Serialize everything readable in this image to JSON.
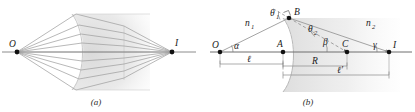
{
  "figure": {
    "type": "optics-diagram",
    "panels": [
      {
        "id": "a",
        "caption": "(a)",
        "points": [
          {
            "label": "O",
            "name": "object-point"
          },
          {
            "label": "I",
            "name": "image-point"
          }
        ]
      },
      {
        "id": "b",
        "caption": "(b)",
        "points": [
          {
            "label": "O",
            "name": "object-point"
          },
          {
            "label": "A",
            "name": "vertex-point"
          },
          {
            "label": "B",
            "name": "incidence-point"
          },
          {
            "label": "C",
            "name": "center-of-curvature"
          },
          {
            "label": "I",
            "name": "image-point"
          }
        ],
        "angles": [
          {
            "label": "θ",
            "sub": "1",
            "name": "angle-of-incidence"
          },
          {
            "label": "θ",
            "sub": "2",
            "name": "angle-of-refraction"
          },
          {
            "label": "α",
            "sub": "",
            "name": "angle-alpha"
          },
          {
            "label": "β",
            "sub": "",
            "name": "angle-beta"
          },
          {
            "label": "γ",
            "sub": "",
            "name": "angle-gamma"
          }
        ],
        "indices": [
          {
            "label": "n",
            "sub": "1",
            "name": "refractive-index-left"
          },
          {
            "label": "n",
            "sub": "2",
            "name": "refractive-index-right"
          }
        ],
        "distances": [
          {
            "label": "ℓ",
            "name": "object-distance"
          },
          {
            "label": "R",
            "name": "radius-of-curvature"
          },
          {
            "label": "ℓ′",
            "name": "image-distance"
          }
        ]
      }
    ],
    "colors": {
      "ray": "#9a9a9a",
      "axis": "#4a4a4a",
      "medium_fill": "#e6e6e6",
      "label": "#1a1a1a",
      "point": "#111111"
    }
  }
}
